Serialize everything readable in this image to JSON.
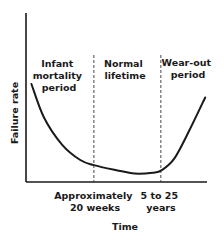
{
  "chart_data": {
    "type": "line",
    "title": "",
    "xlabel": "Time",
    "ylabel": "Failure rate",
    "grid": false,
    "legend": "none",
    "curve_name": "bathtub curve",
    "x_units": "relative time (0 = start, 1 = end of axis)",
    "y_units": "relative failure rate (0 = baseline, 1 = top of axis)",
    "series": [
      {
        "name": "Failure rate",
        "points": [
          [
            0.03,
            0.58
          ],
          [
            0.1,
            0.38
          ],
          [
            0.2,
            0.22
          ],
          [
            0.3,
            0.13
          ],
          [
            0.375,
            0.1
          ],
          [
            0.5,
            0.07
          ],
          [
            0.6,
            0.05
          ],
          [
            0.7,
            0.055
          ],
          [
            0.75,
            0.07
          ],
          [
            0.82,
            0.14
          ],
          [
            0.9,
            0.3
          ],
          [
            0.99,
            0.5
          ]
        ]
      }
    ],
    "dividers": [
      {
        "x": 0.375,
        "label_lines": [
          "Approximately",
          "20 weeks"
        ]
      },
      {
        "x": 0.745,
        "label_lines": [
          "5 to 25",
          "years"
        ]
      }
    ],
    "regions": [
      {
        "name": "infant-mortality",
        "label_lines": [
          "Infant",
          "mortality",
          "period"
        ]
      },
      {
        "name": "normal-lifetime",
        "label_lines": [
          "Normal",
          "lifetime"
        ]
      },
      {
        "name": "wear-out",
        "label_lines": [
          "Wear-out",
          "period"
        ]
      }
    ]
  }
}
